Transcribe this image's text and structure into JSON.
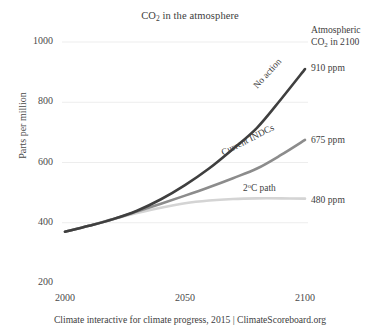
{
  "chart_data": {
    "type": "line",
    "title": "CO2 in the atmosphere",
    "title_prefix": "CO",
    "title_sub": "2",
    "title_suffix": " in the atmosphere",
    "xlabel": "",
    "ylabel": "Parts per million",
    "xlim": [
      2000,
      2100
    ],
    "ylim": [
      200,
      1000
    ],
    "grid": true,
    "legend_position": "inline-on-curves",
    "xticks": [
      "2000",
      "2050",
      "2100"
    ],
    "xtick_values": [
      2000,
      2050,
      2100
    ],
    "yticks": [
      "200",
      "400",
      "600",
      "800",
      "1000"
    ],
    "ytick_values": [
      200,
      400,
      600,
      800,
      1000
    ],
    "x": [
      2000,
      2010,
      2020,
      2030,
      2040,
      2050,
      2060,
      2070,
      2080,
      2090,
      2100
    ],
    "series": [
      {
        "name": "No action",
        "color": "#3f3f3f",
        "end_value": 910,
        "end_label": "910 ppm",
        "values": [
          370,
          390,
          412,
          440,
          478,
          525,
          580,
          645,
          715,
          810,
          910
        ]
      },
      {
        "name": "Current INDCs",
        "color": "#8c8c8c",
        "end_value": 675,
        "end_label": "675 ppm",
        "values": [
          370,
          390,
          412,
          437,
          463,
          490,
          518,
          548,
          580,
          625,
          675
        ]
      },
      {
        "name": "2°C path",
        "color": "#d4d4d4",
        "end_value": 480,
        "end_label": "480 ppm",
        "values": [
          370,
          390,
          412,
          432,
          450,
          465,
          474,
          479,
          481,
          481,
          480
        ]
      }
    ],
    "annotations": {
      "header_line1": "Atmospheric",
      "header_line2_prefix": "CO",
      "header_line2_sub": "2",
      "header_line2_suffix": " in 2100"
    },
    "curve_labels": [
      {
        "text": "No action",
        "rotation": -48
      },
      {
        "text": "Current INDCs",
        "rotation": -27
      },
      {
        "text": "2°C path",
        "rotation": 0,
        "sup": "o",
        "prefix": "2",
        "suffix": "C path"
      }
    ],
    "caption": "Climate interactive for climate progress, 2015 | ClimateScoreboard.org",
    "colors": {
      "no_action": "#3f3f3f",
      "current_indcs": "#8c8c8c",
      "two_c_path": "#d4d4d4",
      "grid": "#ededed",
      "text": "#3d3d3d",
      "background": "#ffffff"
    }
  }
}
